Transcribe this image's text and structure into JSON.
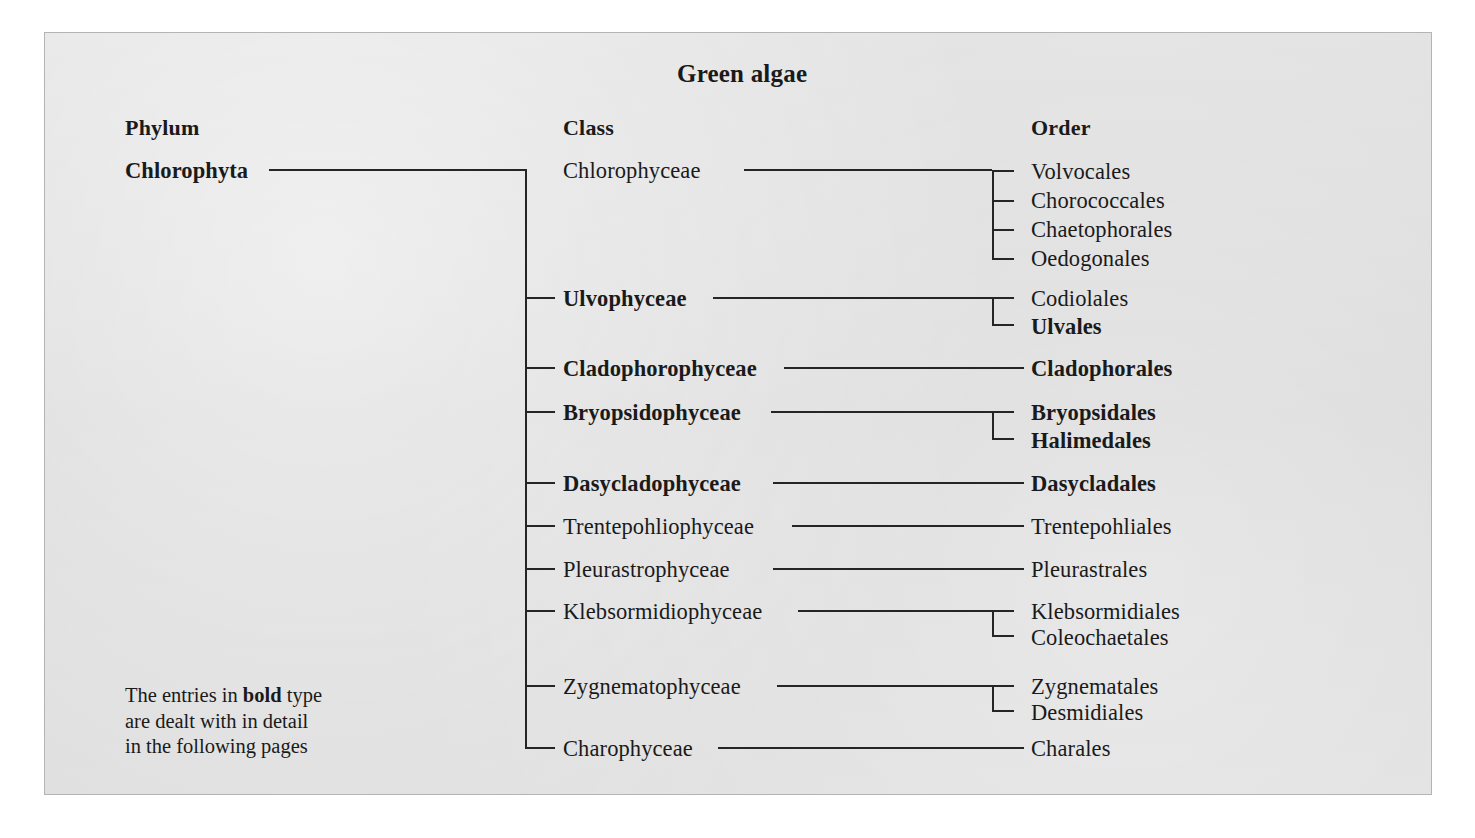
{
  "figure": {
    "title": "Green algae",
    "background_color": "#dcdcdc",
    "line_color": "#252525",
    "text_color": "#1a1a1a"
  },
  "columns": [
    {
      "label": "Phylum"
    },
    {
      "label": "Class"
    },
    {
      "label": "Order"
    }
  ],
  "phylum": {
    "label": "Chlorophyta",
    "bold": true
  },
  "note": {
    "line1_before": "The entries in ",
    "line1_bold": "bold",
    "line1_after": " type",
    "line2": "are dealt with in detail",
    "line3": "in the following pages"
  },
  "taxonomy": {
    "phylum": "Chlorophyta",
    "classes": [
      {
        "name": "Chlorophyceae",
        "bold": false,
        "orders": [
          {
            "name": "Volvocales",
            "bold": false
          },
          {
            "name": "Chorococcales",
            "bold": false
          },
          {
            "name": "Chaetophorales",
            "bold": false
          },
          {
            "name": "Oedogonales",
            "bold": false
          }
        ]
      },
      {
        "name": "Ulvophyceae",
        "bold": true,
        "orders": [
          {
            "name": "Codiolales",
            "bold": false
          },
          {
            "name": "Ulvales",
            "bold": true
          }
        ]
      },
      {
        "name": "Cladophorophyceae",
        "bold": true,
        "orders": [
          {
            "name": "Cladophorales",
            "bold": true
          }
        ]
      },
      {
        "name": "Bryopsidophyceae",
        "bold": true,
        "orders": [
          {
            "name": "Bryopsidales",
            "bold": true
          },
          {
            "name": "Halimedales",
            "bold": true
          }
        ]
      },
      {
        "name": "Dasycladophyceae",
        "bold": true,
        "orders": [
          {
            "name": "Dasycladales",
            "bold": true
          }
        ]
      },
      {
        "name": "Trentepohliophyceae",
        "bold": false,
        "orders": [
          {
            "name": "Trentepohliales",
            "bold": false
          }
        ]
      },
      {
        "name": "Pleurastrophyceae",
        "bold": false,
        "orders": [
          {
            "name": "Pleurastrales",
            "bold": false
          }
        ]
      },
      {
        "name": "Klebsormidiophyceae",
        "bold": false,
        "orders": [
          {
            "name": "Klebsormidiales",
            "bold": false
          },
          {
            "name": "Coleochaetales",
            "bold": false
          }
        ]
      },
      {
        "name": "Zygnematophyceae",
        "bold": false,
        "orders": [
          {
            "name": "Zygnematales",
            "bold": false
          },
          {
            "name": "Desmidiales",
            "bold": false
          }
        ]
      },
      {
        "name": "Charophyceae",
        "bold": false,
        "orders": [
          {
            "name": "Charales",
            "bold": false
          }
        ]
      }
    ]
  }
}
